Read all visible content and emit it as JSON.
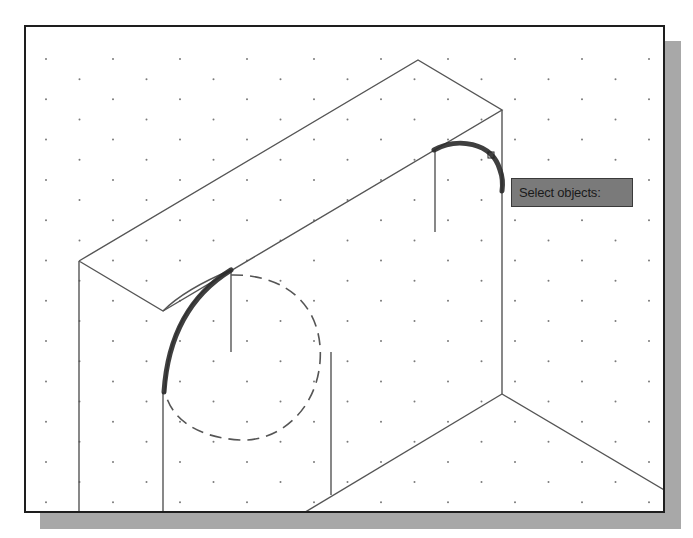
{
  "viewport": {
    "background": "#ffffff",
    "frame_color": "#1e1e1e",
    "shadow_color": "#a8a8a8",
    "grid": {
      "style": "isometric-dots",
      "dx": 67,
      "dy": 40.3,
      "dot_color": "#777777"
    }
  },
  "drawing": {
    "line_color": "#555555",
    "highlight_color": "#2a2a2a",
    "hidden_ellipse_style": "dashed"
  },
  "cursor": {
    "icon": "pickbox-icon"
  },
  "tooltip": {
    "label": "Select objects:",
    "background": "#7a7a7a"
  }
}
